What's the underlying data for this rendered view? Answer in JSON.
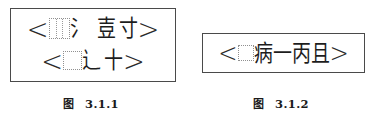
{
  "document": {
    "background_color": "#ffffff",
    "text_color": "#1a1a1a",
    "border_color": "#4a4a4a",
    "dotted_box_color": "#909090"
  },
  "figures": [
    {
      "id": "figure-3-1-1",
      "caption_label": "图",
      "caption_number": "3.1.1",
      "lines": [
        {
          "id": "line-1",
          "open_bracket": "<",
          "tokens": [
            "ruled-dotted-box",
            "氵",
            "壴",
            "寸"
          ],
          "close_bracket": ">"
        },
        {
          "id": "line-2",
          "open_bracket": "<",
          "tokens": [
            "plain-dotted-box",
            "辶",
            "十"
          ],
          "close_bracket": ">"
        }
      ]
    },
    {
      "id": "figure-3-1-2",
      "caption_label": "图",
      "caption_number": "3.1.2",
      "lines": [
        {
          "id": "line-1",
          "open_bracket": "<",
          "tokens": [
            "plain-dotted-box",
            "病",
            "一",
            "丙",
            "且"
          ],
          "close_bracket": ">"
        }
      ]
    }
  ],
  "fig1": {
    "line1": {
      "open": "<",
      "char_water": "氵",
      "char_zhu": "壴",
      "char_cun": "寸",
      "close": ">"
    },
    "line2": {
      "open": "<",
      "char_walk": "辶",
      "char_shi": "十",
      "close": ">"
    },
    "caption_label": "图",
    "caption_number": "3.1.1"
  },
  "fig2": {
    "line1": {
      "open": "<",
      "char_bing_illness": "病",
      "char_yi": "一",
      "char_bing_third": "丙",
      "char_qie": "且",
      "close": ">"
    },
    "caption_label": "图",
    "caption_number": "3.1.2"
  }
}
